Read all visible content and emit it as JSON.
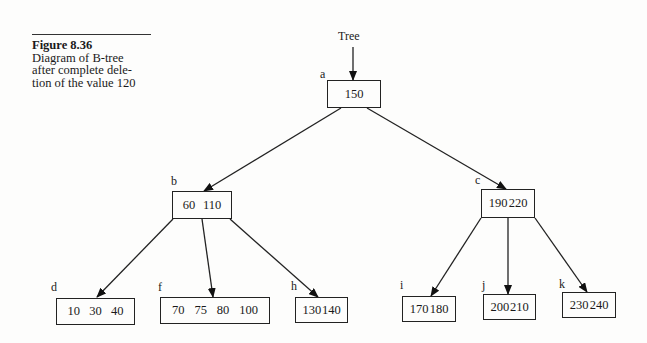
{
  "caption": {
    "figure": "Figure 8.36",
    "lines": [
      "Diagram of B-tree",
      "after complete dele-",
      "tion of the value 120"
    ]
  },
  "root_pointer": {
    "label": "Tree"
  },
  "nodes": {
    "a": {
      "label": "a",
      "keys": [
        "150"
      ]
    },
    "b": {
      "label": "b",
      "keys": [
        "60",
        "110"
      ]
    },
    "c": {
      "label": "c",
      "keys": [
        "190",
        "220"
      ]
    },
    "d": {
      "label": "d",
      "keys": [
        "10",
        "30",
        "40"
      ]
    },
    "f": {
      "label": "f",
      "keys": [
        "70",
        "75",
        "80",
        "100"
      ]
    },
    "h": {
      "label": "h",
      "keys": [
        "130",
        "140"
      ]
    },
    "i": {
      "label": "i",
      "keys": [
        "170",
        "180"
      ]
    },
    "j": {
      "label": "j",
      "keys": [
        "200",
        "210"
      ]
    },
    "k": {
      "label": "k",
      "keys": [
        "230",
        "240"
      ]
    }
  },
  "edges": [
    {
      "from": "Tree",
      "to": "a"
    },
    {
      "from": "a",
      "to": "b"
    },
    {
      "from": "a",
      "to": "c"
    },
    {
      "from": "b",
      "to": "d"
    },
    {
      "from": "b",
      "to": "f"
    },
    {
      "from": "b",
      "to": "h"
    },
    {
      "from": "c",
      "to": "i"
    },
    {
      "from": "c",
      "to": "j"
    },
    {
      "from": "c",
      "to": "k"
    }
  ]
}
